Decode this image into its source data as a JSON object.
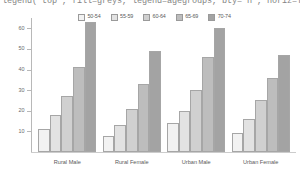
{
  "code_line": {
    "text": "legend(\"top\", fill=greys, legend=agegroups, bty=\"n\", horiz=TRUE)"
  },
  "chart_data": {
    "type": "bar",
    "title": "",
    "subtitle": "",
    "xlabel": "",
    "ylabel": "",
    "ylim": [
      0,
      65
    ],
    "grid": false,
    "legend_position": "top",
    "categories": [
      "Rural Male",
      "Rural Female",
      "Urban Male",
      "Urban Female"
    ],
    "yticks": [
      0,
      10,
      20,
      30,
      40,
      50,
      60
    ],
    "ytick_labels": [
      "0",
      "10",
      "20",
      "30",
      "40",
      "50",
      "60"
    ],
    "series": [
      {
        "name": "50-54",
        "color": "#f2f2f2",
        "values": [
          11,
          8,
          14,
          9
        ]
      },
      {
        "name": "55-59",
        "color": "#e2e2e2",
        "values": [
          18,
          13,
          20,
          16
        ]
      },
      {
        "name": "60-64",
        "color": "#d0d0d0",
        "values": [
          27,
          21,
          30,
          25
        ]
      },
      {
        "name": "65-69",
        "color": "#bdbdbd",
        "values": [
          41,
          33,
          46,
          36
        ]
      },
      {
        "name": "70-74",
        "color": "#a3a3a3",
        "values": [
          63,
          49,
          60,
          47
        ]
      }
    ]
  }
}
